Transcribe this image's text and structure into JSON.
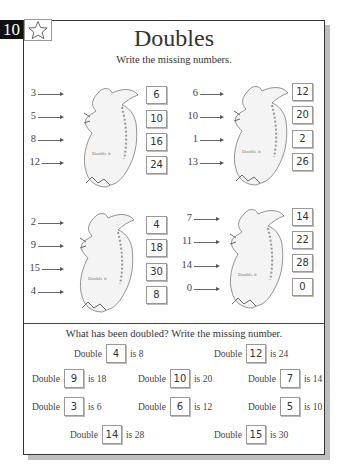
{
  "page": {
    "number": "10",
    "star_icon": "star-outline-icon",
    "title": "Doubles",
    "subtitle": "Write the missing numbers."
  },
  "dragon_groups": [
    {
      "label": "Double it",
      "rows": [
        {
          "input": "3",
          "output": "6"
        },
        {
          "input": "5",
          "output": "10"
        },
        {
          "input": "8",
          "output": "16"
        },
        {
          "input": "12",
          "output": "24"
        }
      ]
    },
    {
      "label": "Double it",
      "rows": [
        {
          "input": "6",
          "output": "12"
        },
        {
          "input": "10",
          "output": "20"
        },
        {
          "input": "1",
          "output": "2"
        },
        {
          "input": "13",
          "output": "26"
        }
      ]
    },
    {
      "label": "Double it",
      "rows": [
        {
          "input": "2",
          "output": "4"
        },
        {
          "input": "9",
          "output": "18"
        },
        {
          "input": "15",
          "output": "30"
        },
        {
          "input": "4",
          "output": "8"
        }
      ]
    },
    {
      "label": "Double it",
      "rows": [
        {
          "input": "7",
          "output": "14"
        },
        {
          "input": "11",
          "output": "22"
        },
        {
          "input": "14",
          "output": "28"
        },
        {
          "input": "0",
          "output": "0"
        }
      ]
    }
  ],
  "section2": {
    "title": "What has been doubled? Write the missing number.",
    "word_double": "Double",
    "items": [
      {
        "answer": "4",
        "result": "is 8"
      },
      {
        "answer": "12",
        "result": "is 24"
      },
      {
        "answer": "9",
        "result": "is 18"
      },
      {
        "answer": "10",
        "result": "is 20"
      },
      {
        "answer": "7",
        "result": "is 14"
      },
      {
        "answer": "3",
        "result": "is 6"
      },
      {
        "answer": "6",
        "result": "is 12"
      },
      {
        "answer": "5",
        "result": "is 10"
      },
      {
        "answer": "14",
        "result": "is 28"
      },
      {
        "answer": "15",
        "result": "is 30"
      }
    ]
  }
}
